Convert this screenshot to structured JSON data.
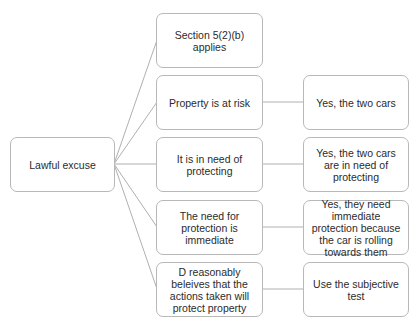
{
  "diagram": {
    "type": "tree",
    "root": {
      "label": "Lawful excuse"
    },
    "branches": [
      {
        "label": "Section 5(2)(b) applies",
        "answer": null
      },
      {
        "label": "Property is at risk",
        "answer": "Yes, the two cars"
      },
      {
        "label": "It is in need of protecting",
        "answer": "Yes, the two cars are in need of protecting"
      },
      {
        "label": "The need for protection is immediate",
        "answer": "Yes, they need immediate protection because the car is rolling towards them"
      },
      {
        "label": "D reasonably beleives that the actions taken will protect property",
        "answer": "Use the subjective test"
      }
    ],
    "colors": {
      "border": "#b8b8b8",
      "line": "#b0b0b0",
      "text": "#2b2b2b",
      "background": "#ffffff"
    }
  }
}
